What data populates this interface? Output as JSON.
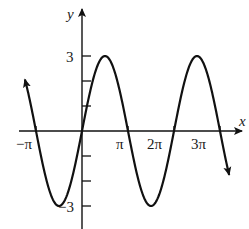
{
  "chart_data": {
    "type": "line",
    "title": "",
    "function": "y = 3 sin(x)",
    "amplitude": 3,
    "xlabel": "x",
    "ylabel": "y",
    "x_ticks": [
      {
        "value": -3.14159,
        "label": "−π"
      },
      {
        "value": 3.14159,
        "label": "π"
      },
      {
        "value": 6.28319,
        "label": "2π"
      },
      {
        "value": 9.42478,
        "label": "3π"
      }
    ],
    "y_ticks": [
      {
        "value": 3,
        "label": "3"
      },
      {
        "value": 2,
        "label": ""
      },
      {
        "value": 1,
        "label": ""
      },
      {
        "value": -1,
        "label": ""
      },
      {
        "value": -2,
        "label": ""
      },
      {
        "value": -3,
        "label": "−3"
      }
    ],
    "xlim": [
      -3.65,
      10.35
    ],
    "ylim": [
      -3.9,
      4.8
    ],
    "curve_domain": [
      -3.9,
      10.05
    ],
    "series": [
      {
        "name": "3 sin x",
        "x": [
          -3.93,
          -3.14,
          -1.57,
          0,
          1.57,
          3.14,
          4.71,
          6.28,
          7.85,
          9.42,
          10.05
        ],
        "y": [
          2.12,
          0,
          -3,
          0,
          3,
          0,
          -3,
          0,
          3,
          0,
          -1.76
        ]
      }
    ],
    "grid": false,
    "legend": "none",
    "color": "#111111"
  },
  "labels": {
    "x_axis": "x",
    "y_axis": "y",
    "tick_3": "3",
    "tick_neg3": "−3",
    "tick_neg_pi": "−π",
    "tick_pi": "π",
    "tick_2pi": "2π",
    "tick_3pi": "3π"
  }
}
